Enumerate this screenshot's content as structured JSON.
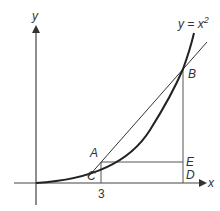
{
  "diagram": {
    "axes": {
      "x_label": "x",
      "y_label": "y"
    },
    "curve_label": "y = x",
    "curve_exponent": "2",
    "points": {
      "A": "A",
      "B": "B",
      "C": "C",
      "D": "D",
      "E": "E"
    },
    "tick_label": "3",
    "colors": {
      "stroke": "#333333",
      "curve": "#222222",
      "background": "#ffffff"
    }
  }
}
